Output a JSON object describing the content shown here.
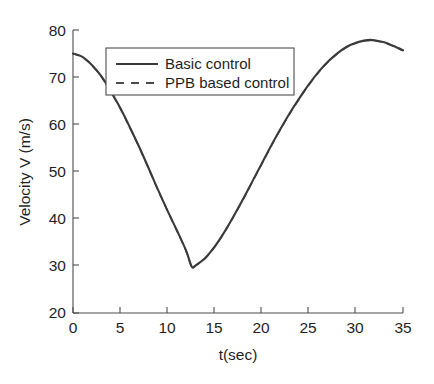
{
  "chart_data": {
    "type": "line",
    "title": "",
    "xlabel": "t(sec)",
    "ylabel": "Velocity V (m/s)",
    "xlim": [
      0,
      35
    ],
    "ylim": [
      20,
      80
    ],
    "xticks": [
      0,
      5,
      10,
      15,
      20,
      25,
      30,
      35
    ],
    "yticks": [
      20,
      30,
      40,
      50,
      60,
      70,
      80
    ],
    "xtick_labels": [
      "0",
      "5",
      "10",
      "15",
      "20",
      "25",
      "30",
      "35"
    ],
    "ytick_labels": [
      "20",
      "30",
      "40",
      "50",
      "60",
      "70",
      "80"
    ],
    "grid": false,
    "legend_position": "upper center",
    "line_color": "#3a3a3a",
    "axis_color": "#4d4d4d",
    "background": "#ffffff",
    "x": [
      0,
      1,
      2,
      3,
      4,
      5,
      6,
      7,
      8,
      9,
      10,
      11,
      12,
      12.6,
      13,
      14,
      15,
      16,
      17,
      18,
      19,
      20,
      21,
      22,
      23,
      24,
      25,
      26,
      27,
      28,
      29,
      30,
      31,
      31.5,
      32,
      33,
      34,
      35
    ],
    "series": [
      {
        "name": "Basic control",
        "style": "solid",
        "values": [
          75.0,
          74.3,
          72.6,
          70.2,
          67.0,
          63.5,
          59.5,
          55.3,
          50.8,
          46.2,
          41.8,
          37.6,
          33.2,
          29.8,
          30.1,
          31.6,
          34.0,
          37.0,
          40.4,
          44.0,
          47.8,
          51.6,
          55.4,
          59.0,
          62.4,
          65.5,
          68.4,
          71.0,
          73.2,
          75.0,
          76.4,
          77.3,
          77.8,
          77.9,
          77.8,
          77.4,
          76.6,
          75.7
        ]
      },
      {
        "name": "PPB based control",
        "style": "dashed",
        "values": [
          75.0,
          74.2,
          72.5,
          70.1,
          66.9,
          63.4,
          59.4,
          55.2,
          50.7,
          46.1,
          41.7,
          37.5,
          33.1,
          29.7,
          30.0,
          31.5,
          33.9,
          36.9,
          40.3,
          43.9,
          47.7,
          51.5,
          55.3,
          58.9,
          62.3,
          65.4,
          68.3,
          70.9,
          73.1,
          74.9,
          76.3,
          77.2,
          77.7,
          77.8,
          77.7,
          77.3,
          76.5,
          75.6
        ]
      }
    ],
    "annotations": {
      "minimum_value": 29.8,
      "minimum_time": 12.6,
      "maximum_value": 77.9,
      "maximum_time": 31.5,
      "start_value": 75.0,
      "end_value": 75.7
    }
  },
  "legend": {
    "entries": [
      {
        "label": "Basic control",
        "style": "solid"
      },
      {
        "label": "PPB based control",
        "style": "dashed"
      }
    ]
  }
}
